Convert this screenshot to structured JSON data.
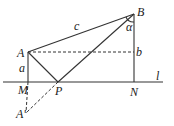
{
  "diagram": {
    "type": "geometry",
    "points": {
      "A": {
        "label": "A",
        "x": 28,
        "y": 52
      },
      "B": {
        "label": "B",
        "x": 134,
        "y": 14
      },
      "M": {
        "label": "M",
        "x": 28,
        "y": 82
      },
      "N": {
        "label": "N",
        "x": 134,
        "y": 82
      },
      "P": {
        "label": "P",
        "x": 58,
        "y": 82
      },
      "A_prime": {
        "label": "A'",
        "x": 26,
        "y": 113
      }
    },
    "line_label": "l",
    "segment_labels": {
      "c": "c",
      "a": "a",
      "b": "b",
      "alpha": "α"
    }
  }
}
